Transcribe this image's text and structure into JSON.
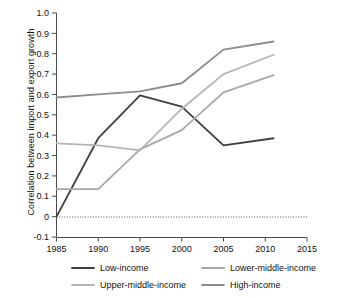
{
  "chart_data": {
    "type": "line",
    "title": "",
    "xlabel": "",
    "ylabel": "Correlation between import and export growth",
    "xlim": [
      1985,
      2015
    ],
    "ylim": [
      -0.1,
      1.0
    ],
    "grid": false,
    "legend_position": "bottom",
    "zero_reference_line": true,
    "x_ticks": [
      "1985",
      "1990",
      "1995",
      "2000",
      "2005",
      "2010",
      "2015"
    ],
    "y_ticks": [
      "-0.1",
      "0",
      "0.1",
      "0.2",
      "0.3",
      "0.4",
      "0.5",
      "0.6",
      "0.7",
      "0.8",
      "0.9",
      "1.0"
    ],
    "x": [
      1985,
      1990,
      1995,
      2000,
      2005,
      2011
    ],
    "series": [
      {
        "name": "Low-income",
        "color": "#3f3f3f",
        "values": [
          0.0,
          0.385,
          0.595,
          0.54,
          0.35,
          0.385
        ]
      },
      {
        "name": "Lower-middle-income",
        "color": "#a8a8a8",
        "values": [
          0.135,
          0.135,
          0.33,
          0.425,
          0.61,
          0.695
        ]
      },
      {
        "name": "Upper-middle-income",
        "color": "#b5b5b5",
        "values": [
          0.36,
          0.35,
          0.325,
          0.53,
          0.7,
          0.795
        ]
      },
      {
        "name": "High-income",
        "color": "#8c8c8c",
        "values": [
          0.585,
          0.6,
          0.615,
          0.655,
          0.82,
          0.86
        ]
      }
    ]
  },
  "legend": {
    "items": [
      {
        "label": "Low-income",
        "color": "#3f3f3f"
      },
      {
        "label": "Lower-middle-income",
        "color": "#a8a8a8"
      },
      {
        "label": "Upper-middle-income",
        "color": "#b5b5b5"
      },
      {
        "label": "High-income",
        "color": "#8c8c8c"
      }
    ]
  },
  "axis": {
    "y_title": "Correlation between import and export growth"
  }
}
